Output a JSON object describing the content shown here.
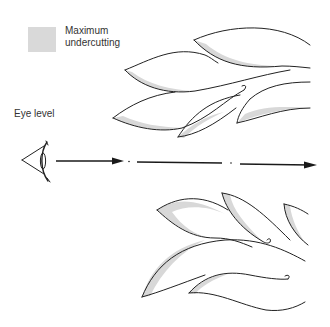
{
  "legend": {
    "swatch_color": "#d9d9d9",
    "label_line1": "Maximum",
    "label_line2": "undercutting"
  },
  "labels": {
    "eye_level": "Eye level"
  },
  "diagram": {
    "line_of_sight": {
      "segments": 3,
      "direction": "left-to-right",
      "arrowheads": 2
    },
    "upper_cluster_shapes": 5,
    "lower_cluster_shapes": 5,
    "colors": {
      "stroke": "#222222",
      "shade": "#d8d8d8",
      "background": "#ffffff"
    }
  }
}
